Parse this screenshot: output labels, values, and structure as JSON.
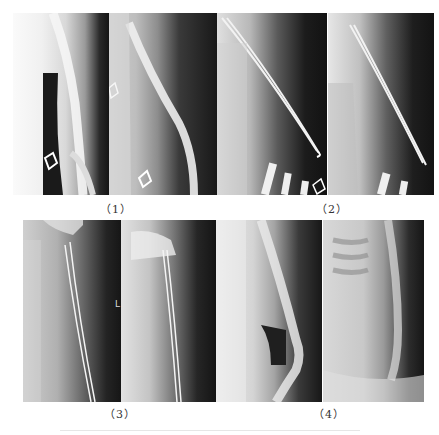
{
  "figure": {
    "panels": [
      {
        "id": "1",
        "label": "（1）",
        "description": "Pre-operative elbow/humerus radiographs, two views, with white diamond markers"
      },
      {
        "id": "2",
        "label": "（2）",
        "description": "Post-operative radiographs showing intramedullary elastic nails in humerus"
      },
      {
        "id": "3",
        "label": "（3）",
        "description": "Follow-up proximal humerus radiographs with elastic nails in situ",
        "marker": "L"
      },
      {
        "id": "4",
        "label": "（4）",
        "description": "Final follow-up radiographs after implant removal"
      }
    ]
  },
  "colors": {
    "background": "#ffffff",
    "label_text": "#333333",
    "xray_dark": "#141414",
    "xray_bone": "#e8e8e8"
  }
}
